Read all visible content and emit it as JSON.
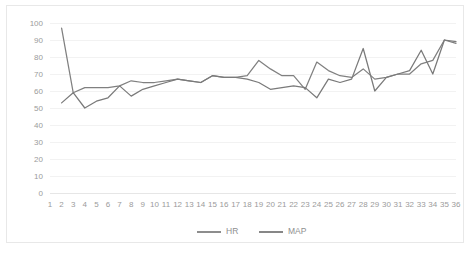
{
  "chart_data": {
    "type": "line",
    "title": "",
    "xlabel": "",
    "ylabel": "",
    "ylim": [
      0,
      100
    ],
    "ytick_step": 10,
    "grid": true,
    "legend_position": "bottom",
    "x": [
      1,
      2,
      3,
      4,
      5,
      6,
      7,
      8,
      9,
      10,
      11,
      12,
      13,
      14,
      15,
      16,
      17,
      18,
      19,
      20,
      21,
      22,
      23,
      24,
      25,
      26,
      27,
      28,
      29,
      30,
      31,
      32,
      33,
      34,
      35,
      36
    ],
    "yticks": [
      "0",
      "10",
      "20",
      "30",
      "40",
      "50",
      "60",
      "70",
      "80",
      "90",
      "100"
    ],
    "xticks": [
      "1",
      "2",
      "3",
      "4",
      "5",
      "6",
      "7",
      "8",
      "9",
      "10",
      "11",
      "12",
      "13",
      "14",
      "15",
      "16",
      "17",
      "18",
      "19",
      "20",
      "21",
      "22",
      "23",
      "24",
      "25",
      "26",
      "27",
      "28",
      "29",
      "30",
      "31",
      "32",
      "33",
      "34",
      "35",
      "36"
    ],
    "series": [
      {
        "name": "HR",
        "color": "#808080",
        "values": [
          null,
          97,
          59,
          62,
          62,
          62,
          63,
          66,
          65,
          65,
          66,
          67,
          66,
          65,
          69,
          68,
          68,
          69,
          78,
          73,
          69,
          69,
          61,
          77,
          72,
          69,
          68,
          73,
          67,
          68,
          70,
          70,
          76,
          78,
          90,
          88
        ]
      },
      {
        "name": "MAP",
        "color": "#7a7a7a",
        "values": [
          null,
          53,
          59,
          50,
          54,
          56,
          63,
          57,
          61,
          63,
          65,
          67,
          66,
          65,
          69,
          68,
          68,
          67,
          65,
          61,
          62,
          63,
          62,
          56,
          67,
          65,
          67,
          85,
          60,
          68,
          70,
          72,
          84,
          70,
          90,
          89
        ]
      }
    ],
    "legend": [
      {
        "label": "HR",
        "color": "#808080"
      },
      {
        "label": "MAP",
        "color": "#7a7a7a"
      }
    ]
  },
  "colors": {
    "background": "#ffffff",
    "border": "#e8e8e8",
    "gridline": "#f2f2f2",
    "tick_text": "#9b9b9b",
    "legend_text": "#8f8f8f"
  }
}
